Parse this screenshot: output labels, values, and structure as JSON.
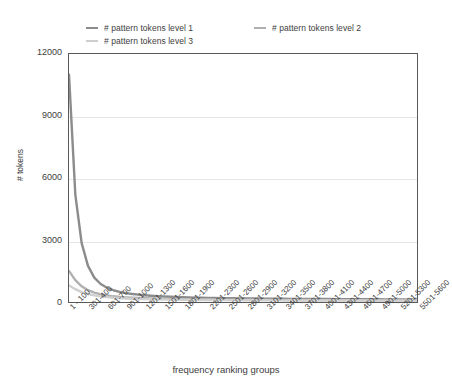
{
  "chart_data": {
    "type": "line",
    "title": "",
    "xlabel": "frequency ranking groups",
    "ylabel": "# tokens",
    "ylim": [
      0,
      12000
    ],
    "yticks": [
      0,
      3000,
      6000,
      9000,
      12000
    ],
    "ytick_labels": [
      "0",
      "3000",
      "6000",
      "9000",
      "12000"
    ],
    "grid": true,
    "legend_position": "top",
    "categories": [
      "1 - 100",
      "101-200",
      "201-300",
      "301-400",
      "401-500",
      "501-600",
      "601-700",
      "701-800",
      "801-900",
      "901-1000",
      "1001-1100",
      "1101-1200",
      "1201-1300",
      "1301-1400",
      "1401-1500",
      "1501-1600",
      "1601-1700",
      "1701-1800",
      "1801-1900",
      "1901-2000",
      "2001-2100",
      "2101-2200",
      "2201-2300",
      "2301-2400",
      "2401-2500",
      "2501-2600",
      "2601-2700",
      "2701-2800",
      "2801-2900",
      "2901-3000",
      "3001-3100",
      "3101-3200",
      "3201-3300",
      "3301-3400",
      "3401-3500",
      "3501-3600",
      "3601-3700",
      "3701-3800",
      "3801-3900",
      "3901-4000",
      "4001-4100",
      "4101-4200",
      "4201-4300",
      "4301-4400",
      "4401-4500",
      "4501-4600",
      "4601-4700",
      "4701-4800",
      "4801-4900",
      "4901-5000",
      "5001-5100",
      "5101-5200",
      "5201-5300",
      "5301-5400",
      "5401-5500",
      "5501-5600"
    ],
    "xtick_labels": [
      "1 - 100",
      "301-400",
      "601-700",
      "901-1000",
      "1201-1300",
      "1501-1600",
      "1801-1900",
      "2201-2300",
      "2501-2600",
      "2801-2900",
      "3101-3200",
      "3401-3500",
      "3701-3800",
      "4001-4100",
      "4301-4400",
      "4601-4700",
      "4901-5000",
      "5201-5300",
      "5501-5600"
    ],
    "xtick_indices": [
      0,
      3,
      6,
      9,
      12,
      15,
      18,
      22,
      25,
      28,
      31,
      34,
      37,
      40,
      43,
      46,
      49,
      52,
      55
    ],
    "series": [
      {
        "name": "# pattern tokens level 1",
        "color": "#8c8c8c",
        "values": [
          11000,
          5200,
          2850,
          1750,
          1180,
          870,
          690,
          570,
          490,
          430,
          390,
          355,
          325,
          300,
          282,
          266,
          252,
          240,
          230,
          221,
          213,
          206,
          200,
          194,
          189,
          184,
          180,
          176,
          172,
          169,
          166,
          163,
          160,
          158,
          155,
          153,
          151,
          149,
          147,
          145,
          143,
          142,
          140,
          139,
          137,
          136,
          134,
          133,
          132,
          131,
          129,
          128,
          127,
          126,
          125,
          124
        ]
      },
      {
        "name": "# pattern tokens level 2",
        "color": "#b0b0b0",
        "values": [
          1500,
          1060,
          760,
          570,
          450,
          370,
          315,
          275,
          245,
          222,
          204,
          190,
          178,
          168,
          160,
          153,
          147,
          142,
          137,
          133,
          129,
          126,
          123,
          120,
          117,
          115,
          113,
          111,
          109,
          107,
          105,
          104,
          102,
          101,
          99,
          98,
          97,
          96,
          95,
          94,
          93,
          92,
          91,
          90,
          89,
          88,
          88,
          87,
          86,
          86,
          85,
          84,
          84,
          83,
          83,
          82
        ]
      },
      {
        "name": "# pattern tokens level 3",
        "color": "#cfcfcf",
        "values": [
          800,
          620,
          480,
          385,
          318,
          270,
          234,
          207,
          186,
          170,
          157,
          146,
          137,
          130,
          124,
          118,
          114,
          110,
          106,
          103,
          100,
          97,
          95,
          93,
          91,
          89,
          87,
          86,
          84,
          83,
          82,
          81,
          79,
          78,
          77,
          77,
          76,
          75,
          74,
          73,
          73,
          72,
          71,
          71,
          70,
          70,
          69,
          69,
          68,
          68,
          67,
          67,
          66,
          66,
          65,
          65
        ]
      }
    ]
  }
}
